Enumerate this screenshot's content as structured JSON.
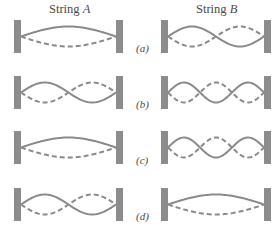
{
  "figure": {
    "columns": [
      {
        "id": "A",
        "prefix": "String ",
        "name": "A"
      },
      {
        "id": "B",
        "prefix": "String ",
        "name": "B"
      }
    ],
    "rows": [
      {
        "label": "(a)",
        "string_A_loops": 1,
        "string_B_loops": 2
      },
      {
        "label": "(b)",
        "string_A_loops": 2,
        "string_B_loops": 3
      },
      {
        "label": "(c)",
        "string_A_loops": 1,
        "string_B_loops": 3
      },
      {
        "label": "(d)",
        "string_A_loops": 2,
        "string_B_loops": 1
      }
    ],
    "colors": {
      "wall": "#8c8c8c",
      "string": "#8a8a8a",
      "text": "#4a4a4a"
    }
  }
}
